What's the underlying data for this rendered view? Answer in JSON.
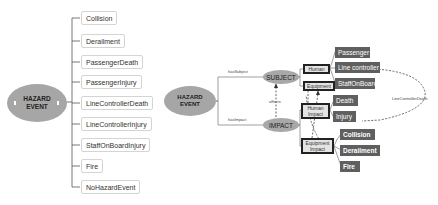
{
  "left_tree": {
    "root": {
      "line1": "HAZARD",
      "line2": "EVENT"
    },
    "children": [
      {
        "label": "Collision"
      },
      {
        "label": "Derailment"
      },
      {
        "label": "PassengerDeath"
      },
      {
        "label": "PassengerInjury"
      },
      {
        "label": "LineControllerDeath"
      },
      {
        "label": "LineControllerInjury"
      },
      {
        "label": "StaffOnBoardInjury"
      },
      {
        "label": "Fire"
      },
      {
        "label": "NoHazardEvent"
      }
    ]
  },
  "right_graph": {
    "root": {
      "line1": "HAZARD",
      "line2": "EVENT"
    },
    "subject": "SUBJECT",
    "impact": "IMPACT",
    "edges": {
      "has_subject": "hasSubject",
      "has_impact": "hasImpact",
      "affects": "affects",
      "line_controller_death": "LineControllerDeath"
    },
    "subject_types": {
      "human": "Human",
      "equipment": "Equipment"
    },
    "human_subtypes": [
      "Passenger",
      "Line controller",
      "StaffOnBoard"
    ],
    "impact_types": {
      "human_impact": {
        "line1": "Human",
        "line2": "Impact"
      },
      "equipment_impact": {
        "line1": "Equipment",
        "line2": "Impact"
      }
    },
    "human_impacts": [
      "Death",
      "Injury"
    ],
    "equipment_impacts": [
      "Collision",
      "Derailment",
      "Fire"
    ]
  },
  "colors": {
    "ellipse": "#a6a6a6",
    "dark_box": "#5f5f5f",
    "outlined_box": "#e4e4e4"
  }
}
